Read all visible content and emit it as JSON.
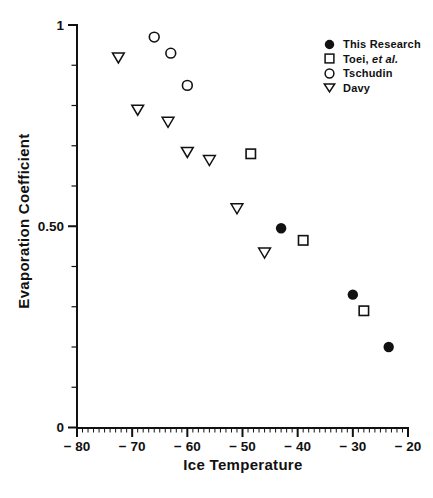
{
  "figure": {
    "background": "#ffffff",
    "ink": "#111111"
  },
  "legend": {
    "items": [
      {
        "marker": "filled-circle",
        "label": "This Research"
      },
      {
        "marker": "open-square",
        "label": "Toei, ",
        "label_italic": "et al."
      },
      {
        "marker": "open-circle",
        "label": "Tschudin"
      },
      {
        "marker": "open-triangle",
        "label": "Davy"
      }
    ]
  },
  "chart_data": {
    "type": "scatter",
    "title": "",
    "xlabel": "Ice Temperature",
    "ylabel": "Evaporation Coefficient",
    "xlim": [
      -80,
      -20
    ],
    "ylim": [
      0,
      1
    ],
    "grid": false,
    "legend_position": "top-right",
    "x_major_ticks": [
      -80,
      -70,
      -60,
      -50,
      -40,
      -30,
      -20
    ],
    "x_tick_labels": [
      "− 80",
      "− 70",
      "− 60",
      "− 50",
      "− 40",
      "− 30",
      "− 20"
    ],
    "x_minor_step": 1,
    "y_labeled_ticks": [
      0,
      0.5,
      1
    ],
    "y_tick_labels": [
      "0",
      "0.50",
      "1"
    ],
    "y_minor_step": 0.1,
    "series": [
      {
        "name": "This Research",
        "marker": "filled-circle",
        "points": [
          [
            -43,
            0.495
          ],
          [
            -30,
            0.33
          ],
          [
            -23.5,
            0.2
          ]
        ]
      },
      {
        "name": "Toei, et al.",
        "marker": "open-square",
        "points": [
          [
            -48.5,
            0.68
          ],
          [
            -39,
            0.465
          ],
          [
            -28,
            0.29
          ]
        ]
      },
      {
        "name": "Tschudin",
        "marker": "open-circle",
        "points": [
          [
            -66,
            0.97
          ],
          [
            -63,
            0.93
          ],
          [
            -60,
            0.85
          ]
        ]
      },
      {
        "name": "Davy",
        "marker": "open-triangle",
        "points": [
          [
            -72.5,
            0.92
          ],
          [
            -69,
            0.79
          ],
          [
            -63.5,
            0.76
          ],
          [
            -60,
            0.685
          ],
          [
            -56,
            0.665
          ],
          [
            -51,
            0.545
          ],
          [
            -46,
            0.435
          ]
        ]
      }
    ]
  }
}
